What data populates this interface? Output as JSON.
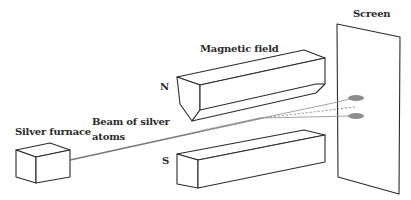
{
  "labels": {
    "magnetic_field": "Magnetic field",
    "screen": "Screen",
    "north_pole": "N",
    "south_pole": "S",
    "furnace": "Silver furnace",
    "beam_line1": "Beam of silver",
    "beam_line2": "atoms"
  },
  "components": [
    {
      "id": "furnace",
      "name": "Silver furnace"
    },
    {
      "id": "magnet-north",
      "name": "North magnet pole"
    },
    {
      "id": "magnet-south",
      "name": "South magnet pole"
    },
    {
      "id": "beam",
      "name": "Beam of silver atoms"
    },
    {
      "id": "screen",
      "name": "Screen"
    }
  ],
  "colors": {
    "line": "#2b2b2b",
    "beam": "#8a8a8a",
    "spot": "#8c8c8c",
    "background": "#ffffff"
  },
  "deposit_spots": 2
}
